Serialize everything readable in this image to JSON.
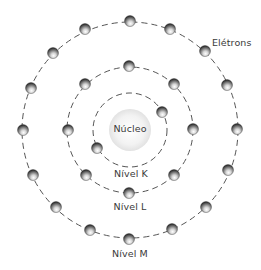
{
  "diagram": {
    "center": {
      "x": 130,
      "y": 130
    },
    "nucleus": {
      "label": "Núcleo",
      "radius": 21,
      "color_light": "#ffffff",
      "color_dark": "#e4e4e4"
    },
    "ring_color": "#555555",
    "electron_colors": {
      "highlight": "#ffffff",
      "mid": "#b8b8b8",
      "dark": "#2a2a2a"
    },
    "electrons_label": "Elétrons",
    "levels": [
      {
        "name": "K",
        "label": "Nível K",
        "radius": 37,
        "electrons": [
          [
            162,
            112
          ],
          [
            97,
            148
          ]
        ]
      },
      {
        "name": "L",
        "label": "Nível L",
        "radius": 63,
        "electrons": [
          [
            129,
            66
          ],
          [
            174,
            84
          ],
          [
            193,
            129
          ],
          [
            174,
            175
          ],
          [
            129,
            193
          ],
          [
            86,
            175
          ],
          [
            68,
            130
          ],
          [
            85,
            84
          ]
        ]
      },
      {
        "name": "M",
        "label": "Nível M",
        "radius": 108,
        "electrons": [
          [
            130,
            21
          ],
          [
            170,
            29
          ],
          [
            205,
            51
          ],
          [
            227,
            85
          ],
          [
            237,
            129
          ],
          [
            228,
            170
          ],
          [
            206,
            207
          ],
          [
            172,
            229
          ],
          [
            129,
            239
          ],
          [
            90,
            230
          ],
          [
            56,
            207
          ],
          [
            33,
            175
          ],
          [
            23,
            130
          ],
          [
            31,
            88
          ],
          [
            53,
            53
          ],
          [
            85,
            29
          ]
        ]
      }
    ]
  }
}
